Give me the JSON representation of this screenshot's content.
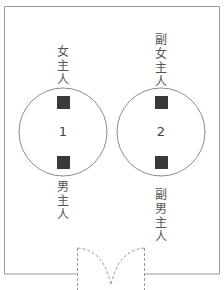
{
  "diagram": {
    "type": "seating-arrangement",
    "room": {
      "stroke": "#9a9a9a"
    },
    "door": {
      "style": "dashed double door"
    },
    "tables": [
      {
        "number": "1",
        "top_label": [
          "女",
          "主",
          "人"
        ],
        "bottom_label": [
          "男",
          "主",
          "人"
        ]
      },
      {
        "number": "2",
        "top_label": [
          "副",
          "女",
          "主",
          "人"
        ],
        "bottom_label": [
          "副",
          "男",
          "主",
          "人"
        ]
      }
    ],
    "colors": {
      "seat": "#3a3a3a",
      "circle": "#8a8a8a",
      "text": "#555555"
    }
  }
}
